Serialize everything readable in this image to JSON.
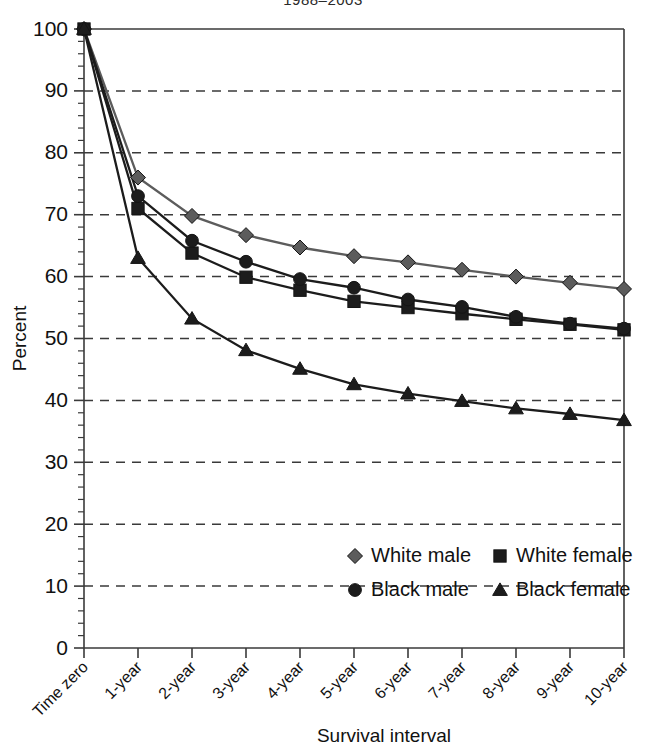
{
  "chart_data": {
    "type": "line",
    "title": "1988–2003",
    "xlabel": "Survival interval",
    "ylabel": "Percent",
    "categories": [
      "Time zero",
      "1-year",
      "2-year",
      "3-year",
      "4-year",
      "5-year",
      "6-year",
      "7-year",
      "8-year",
      "9-year",
      "10-year"
    ],
    "ylim": [
      0,
      100
    ],
    "yticks": [
      0,
      10,
      20,
      30,
      40,
      50,
      60,
      70,
      80,
      90,
      100
    ],
    "ytick_labels": [
      "0",
      "10",
      "20",
      "30",
      "40",
      "50",
      "60",
      "70",
      "80",
      "90",
      "100"
    ],
    "y_minor_tick_step": 2,
    "grid": "horizontal-dashed",
    "legend_position": "lower-center",
    "series": [
      {
        "name": "White male",
        "marker": "diamond",
        "color": "#5c5c5c",
        "values": [
          100,
          76.0,
          69.8,
          66.7,
          64.7,
          63.3,
          62.3,
          61.1,
          60.0,
          59.0,
          58.0
        ]
      },
      {
        "name": "White female",
        "marker": "square",
        "color": "#1c1c1c",
        "values": [
          100,
          71.0,
          63.8,
          59.9,
          57.8,
          56.0,
          55.0,
          54.0,
          53.1,
          52.3,
          51.4
        ]
      },
      {
        "name": "Black male",
        "marker": "circle",
        "color": "#1c1c1c",
        "values": [
          100,
          73.0,
          65.8,
          62.4,
          59.6,
          58.2,
          56.3,
          55.1,
          53.5,
          52.4,
          51.6
        ]
      },
      {
        "name": "Black female",
        "marker": "triangle",
        "color": "#1c1c1c",
        "values": [
          100,
          63.0,
          53.2,
          48.1,
          45.1,
          42.6,
          41.1,
          39.9,
          38.7,
          37.8,
          36.8
        ]
      }
    ]
  },
  "legend": {
    "entries": [
      {
        "label": "White male",
        "marker": "diamond",
        "color": "#5c5c5c"
      },
      {
        "label": "White female",
        "marker": "square",
        "color": "#1c1c1c"
      },
      {
        "label": "Black male",
        "marker": "circle",
        "color": "#1c1c1c"
      },
      {
        "label": "Black female",
        "marker": "triangle",
        "color": "#1c1c1c"
      }
    ]
  }
}
